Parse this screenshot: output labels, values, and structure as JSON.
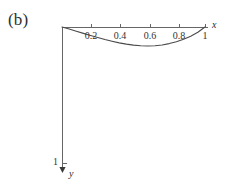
{
  "figure": {
    "panel_label": "(b)",
    "background_color": "#ffffff",
    "line_color": "#555555",
    "curve_color": "#4a4a4a",
    "text_color": "#2e2e2e"
  },
  "axes": {
    "x": {
      "name": "x",
      "name_x": 212,
      "name_y": 19,
      "origin_px": {
        "x": 62,
        "y": 27
      },
      "end_px": {
        "x": 208,
        "y": 27
      },
      "min": 0,
      "max": 1,
      "ticks": [
        {
          "value": 0.2,
          "label": "0.2",
          "px": 91
        },
        {
          "value": 0.4,
          "label": "0.4",
          "px": 120
        },
        {
          "value": 0.6,
          "label": "0.6",
          "px": 150
        },
        {
          "value": 0.8,
          "label": "0.8",
          "px": 179
        },
        {
          "value": 1.0,
          "label": "1",
          "px": 205
        }
      ],
      "tick_label_y": 30
    },
    "y": {
      "name": "y",
      "name_x": 69,
      "name_y": 168,
      "direction": "down",
      "origin_px": {
        "x": 62,
        "y": 27
      },
      "end_px": {
        "x": 62,
        "y": 172
      },
      "ticks": [
        {
          "value": 1,
          "label": "1",
          "px": 163
        }
      ]
    }
  },
  "chart_data": {
    "type": "line",
    "title": "(b)",
    "xlabel": "x",
    "ylabel": "y",
    "xlim": [
      0,
      1
    ],
    "ylim": [
      0,
      1
    ],
    "grid": false,
    "legend": null,
    "y_axis_inverted": true,
    "note": "Deflection curve: sags downward from 0 at x=0 to a minimum near x=0.6, returning to 0 at x=1",
    "series": [
      {
        "name": "deflection",
        "x": [
          0.0,
          0.05,
          0.1,
          0.15,
          0.2,
          0.25,
          0.3,
          0.35,
          0.4,
          0.45,
          0.5,
          0.55,
          0.6,
          0.65,
          0.7,
          0.75,
          0.8,
          0.85,
          0.9,
          0.95,
          1.0
        ],
        "y": [
          0.0,
          0.015,
          0.031,
          0.047,
          0.062,
          0.077,
          0.092,
          0.105,
          0.117,
          0.126,
          0.133,
          0.138,
          0.14,
          0.138,
          0.132,
          0.122,
          0.108,
          0.09,
          0.068,
          0.039,
          0.0
        ]
      }
    ]
  }
}
